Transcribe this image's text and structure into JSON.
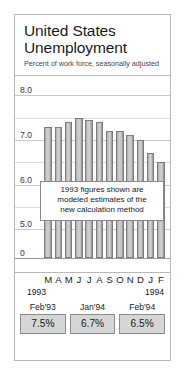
{
  "header": {
    "title_line1": "United States",
    "title_line2": "Unemployment",
    "subtitle": "Percent of work force, seasonally adjusted"
  },
  "callout": {
    "line1": "1993 figures shown are",
    "line2": "modeled estimates of the",
    "line3": "new calculation method"
  },
  "axis": {
    "year_left": "1993",
    "year_right": "1994"
  },
  "stats": [
    {
      "label": "Feb'93",
      "value": "7.5%"
    },
    {
      "label": "Jan'94",
      "value": "6.7%"
    },
    {
      "label": "Feb'94",
      "value": "6.5%"
    }
  ],
  "colors": {
    "bar_fill": "#c8c8c8",
    "bar_stroke": "#7d7d7d",
    "grid": "#c9c9c9",
    "frame": "#b9b9b9",
    "stat_box": "#d6d6d6",
    "text": "#1b1b1b"
  },
  "chart_data": {
    "type": "bar",
    "title": "United States Unemployment",
    "subtitle": "Percent of work force, seasonally adjusted",
    "xlabel": "",
    "ylabel": "Percent of work force",
    "categories": [
      "M",
      "A",
      "M",
      "J",
      "J",
      "A",
      "S",
      "O",
      "N",
      "D",
      "J",
      "F"
    ],
    "category_full": [
      "Mar 1993",
      "Apr 1993",
      "May 1993",
      "Jun 1993",
      "Jul 1993",
      "Aug 1993",
      "Sep 1993",
      "Oct 1993",
      "Nov 1993",
      "Dec 1993",
      "Jan 1994",
      "Feb 1994"
    ],
    "values": [
      7.3,
      7.3,
      7.4,
      7.5,
      7.45,
      7.4,
      7.2,
      7.2,
      7.1,
      7.0,
      6.7,
      6.5
    ],
    "ylim": [
      4.6,
      8.3
    ],
    "yticks": [
      0,
      5.0,
      6.0,
      7.0,
      8.0
    ],
    "ytick_labels": [
      "0",
      "5.0",
      "6.0",
      "7.0",
      "8.0"
    ],
    "minor_yticks": [
      5.5,
      6.5,
      7.5
    ],
    "axis_break": true,
    "grid": true,
    "legend": false,
    "annotations": [
      "1993 figures shown are modeled estimates of the new calculation method"
    ]
  }
}
